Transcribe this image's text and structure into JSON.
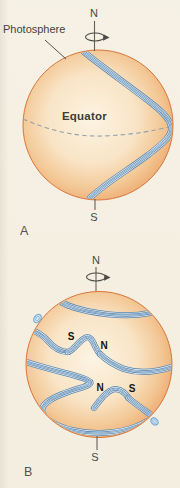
{
  "panel_a": {
    "letter": "A",
    "photosphere_label": "Photosphere",
    "equator_label": "Equator",
    "north_pole_label": "N",
    "south_pole_label": "S"
  },
  "panel_b": {
    "letter": "B",
    "north_pole_label": "N",
    "south_pole_label": "S",
    "polarity_labels": {
      "upper_left": "S",
      "upper_right": "N",
      "lower_left": "N",
      "lower_right": "S"
    }
  },
  "icons": {
    "rotation_arrow": "rotation-arrow-icon"
  },
  "colors": {
    "background": "#F5F0E3",
    "sphere_limb": "#E57E42",
    "sphere_center": "#FCF4E3",
    "field_line_dark": "#5E87AC",
    "field_line_light": "#D9E9F5",
    "axis_gray": "#63605B",
    "label_text": "#45423C"
  }
}
